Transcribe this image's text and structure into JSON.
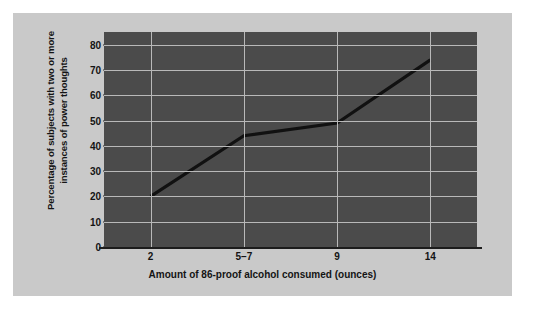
{
  "chart_data": {
    "type": "line",
    "title": "",
    "xlabel": "Amount of 86-proof alcohol consumed (ounces)",
    "ylabel": "Percentage of subjects with two or more instances of power thoughts",
    "ylabel_line1": "Percentage of subjects with two or more",
    "ylabel_line2": "instances of power thoughts",
    "categories": [
      "2",
      "5–7",
      "9",
      "14"
    ],
    "values": [
      20,
      44,
      49,
      74
    ],
    "ylim": [
      0,
      85
    ],
    "yticks": [
      0,
      10,
      20,
      30,
      40,
      50,
      60,
      70,
      80
    ],
    "ytick_labels": [
      "0",
      "10",
      "20",
      "30",
      "40",
      "50",
      "60",
      "70",
      "80"
    ],
    "grid": true,
    "grid_horizontal": true,
    "grid_vertical": true,
    "legend": false,
    "legend_position": "none",
    "series": [
      {
        "name": "Percentage with two or more power thoughts",
        "values": [
          20,
          44,
          49,
          74
        ]
      }
    ],
    "colors": {
      "plot_background": "#4b4b4b",
      "figure_background": "#c9c9c9",
      "page_background": "#ffffff",
      "gridline": "#b9b9b9",
      "line": "#111111",
      "axis": "#1c1c1c",
      "text": "#141414"
    }
  }
}
